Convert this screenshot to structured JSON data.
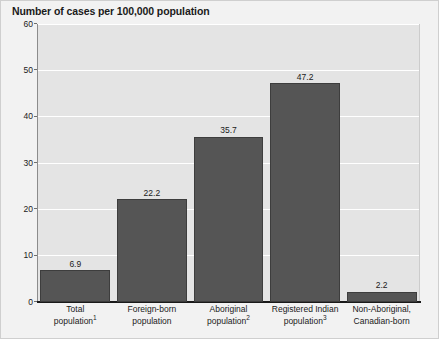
{
  "chart_data": {
    "type": "bar",
    "title": "Number of cases per 100,000 population",
    "xlabel": "",
    "ylabel": "",
    "ylim": [
      0,
      60
    ],
    "yticks": [
      0,
      10,
      20,
      30,
      40,
      50,
      60
    ],
    "grid": true,
    "legend": "none",
    "bar_color": "#555555",
    "plot_background": "#e4e4e4",
    "figure_background": "#f2f2f2",
    "gridline_color": "#ffffff",
    "categories": [
      "Total population¹",
      "Foreign-born population",
      "Aboriginal population²",
      "Registered Indian population³",
      "Non-Aboriginal, Canadian-born"
    ],
    "values": [
      6.9,
      35.7,
      47.2,
      2.2,
      22.2
    ],
    "value_labels": [
      "6.9",
      "22.2",
      "35.7",
      "47.2",
      "2.2"
    ],
    "bars": [
      {
        "value": 6.9,
        "value_label": "6.9",
        "label_line1": "Total",
        "label_line2": "population",
        "label_superscript": "1"
      },
      {
        "value": 22.2,
        "value_label": "22.2",
        "label_line1": "Foreign-born",
        "label_line2": "population",
        "label_superscript": ""
      },
      {
        "value": 35.7,
        "value_label": "35.7",
        "label_line1": "Aboriginal",
        "label_line2": "population",
        "label_superscript": "2"
      },
      {
        "value": 47.2,
        "value_label": "47.2",
        "label_line1": "Registered Indian",
        "label_line2": "population",
        "label_superscript": "3"
      },
      {
        "value": 2.2,
        "value_label": "2.2",
        "label_line1": "Non-Aboriginal,",
        "label_line2": "Canadian-born",
        "label_superscript": ""
      }
    ]
  }
}
